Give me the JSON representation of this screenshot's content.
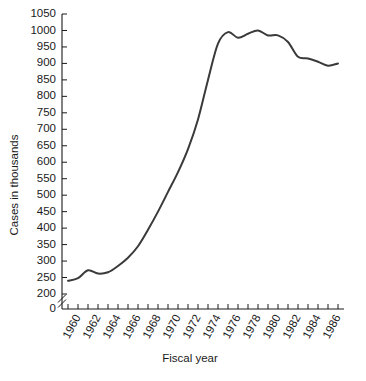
{
  "chart_data": {
    "type": "line",
    "title": "",
    "xlabel": "Fiscal year",
    "ylabel": "Cases in thousands",
    "xlim": [
      1959,
      1986
    ],
    "ylim": [
      200,
      1050
    ],
    "y_axis_break": true,
    "y_break_labels": [
      "0",
      "200"
    ],
    "grid": false,
    "legend": null,
    "ytick_labels": [
      "0",
      "200",
      "250",
      "300",
      "350",
      "400",
      "450",
      "500",
      "550",
      "600",
      "650",
      "700",
      "750",
      "800",
      "850",
      "900",
      "950",
      "1000",
      "1050"
    ],
    "ytick_values": [
      200,
      250,
      300,
      350,
      400,
      450,
      500,
      550,
      600,
      650,
      700,
      750,
      800,
      850,
      900,
      950,
      1000,
      1050
    ],
    "xtick_labels": [
      "1960",
      "1962",
      "1964",
      "1966",
      "1968",
      "1970",
      "1972",
      "1974",
      "1976",
      "1978",
      "1980",
      "1982",
      "1984",
      "1986"
    ],
    "xtick_values": [
      1960,
      1962,
      1964,
      1966,
      1968,
      1970,
      1972,
      1974,
      1976,
      1978,
      1980,
      1982,
      1984,
      1986
    ],
    "x": [
      1959,
      1960,
      1961,
      1962,
      1963,
      1964,
      1965,
      1966,
      1967,
      1968,
      1969,
      1970,
      1971,
      1972,
      1973,
      1974,
      1975,
      1976,
      1977,
      1978,
      1979,
      1980,
      1981,
      1982,
      1983,
      1984,
      1985,
      1986
    ],
    "values": [
      240,
      248,
      272,
      262,
      266,
      285,
      310,
      345,
      395,
      450,
      510,
      570,
      640,
      730,
      850,
      960,
      995,
      978,
      990,
      1000,
      985,
      985,
      965,
      920,
      915,
      905,
      893,
      900
    ],
    "series": [
      {
        "name": "Cases",
        "color": "#3a3a3a",
        "values": [
          240,
          248,
          272,
          262,
          266,
          285,
          310,
          345,
          395,
          450,
          510,
          570,
          640,
          730,
          850,
          960,
          995,
          978,
          990,
          1000,
          985,
          985,
          965,
          920,
          915,
          905,
          893,
          900
        ]
      }
    ]
  },
  "caption": {
    "text": ""
  }
}
